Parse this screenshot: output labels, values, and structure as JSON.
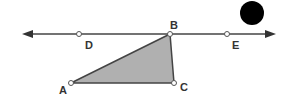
{
  "diagram": {
    "line": {
      "x1": 22,
      "y": 34,
      "x2": 276,
      "color": "#444444"
    },
    "points": {
      "D": {
        "label": "D",
        "x": 79,
        "y": 34
      },
      "B": {
        "label": "B",
        "x": 170,
        "y": 34
      },
      "E": {
        "label": "E",
        "x": 227,
        "y": 34
      },
      "A": {
        "label": "A",
        "x": 71,
        "y": 83
      },
      "C": {
        "label": "C",
        "x": 174,
        "y": 83
      }
    },
    "triangle": {
      "vertices": [
        "A",
        "B",
        "C"
      ],
      "fill": "#b0b0b0"
    },
    "dot": {
      "cx": 252,
      "cy": 13,
      "r": 12,
      "color": "#000000"
    }
  }
}
